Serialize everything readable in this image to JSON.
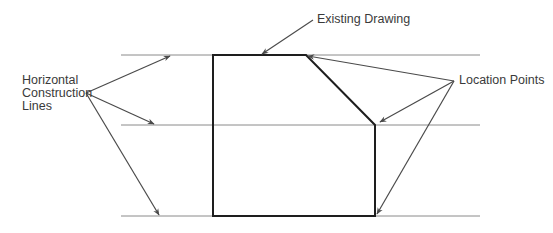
{
  "diagram": {
    "labels": {
      "existing_drawing": "Existing Drawing",
      "location_points": "Location Points",
      "horizontal_construction_lines": [
        "Horizontal",
        "Construction",
        "Lines"
      ]
    },
    "colors": {
      "construction_line": "#8a8a8a",
      "drawing_outline": "#1e1e1e",
      "leader_arrow": "#4a4a4a",
      "text": "#3a3a3a"
    },
    "construction_lines_y": [
      55,
      125,
      216
    ],
    "construction_lines_x_range": [
      121,
      480
    ],
    "existing_drawing_outline": [
      [
        213,
        55
      ],
      [
        306,
        55
      ],
      [
        375,
        125
      ],
      [
        375,
        216
      ],
      [
        213,
        216
      ]
    ]
  }
}
